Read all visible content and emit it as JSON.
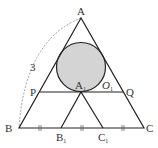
{
  "diagram": {
    "type": "geometry",
    "colors": {
      "line": "#222222",
      "circle_fill": "#d4d4d4",
      "dashed_arc": "#777777"
    },
    "points": {
      "A": {
        "label": "A",
        "x": 81,
        "y": 18
      },
      "B": {
        "label": "B",
        "x": 19,
        "y": 128
      },
      "C": {
        "label": "C",
        "x": 144,
        "y": 128
      },
      "P": {
        "label": "P",
        "x": 40,
        "y": 92
      },
      "Q": {
        "label": "Q",
        "x": 123,
        "y": 92
      },
      "A1": {
        "label": "A",
        "sub": "1",
        "x": 81,
        "y": 92
      },
      "B1": {
        "label": "B",
        "sub": "1",
        "x": 61,
        "y": 128
      },
      "C1": {
        "label": "C",
        "sub": "1",
        "x": 103,
        "y": 128
      },
      "O1": {
        "label": "O",
        "sub": "1",
        "x": 81,
        "y": 68
      }
    },
    "circle": {
      "center": "O1",
      "radius": 24
    },
    "side_label": "3",
    "tick_marks": "||"
  }
}
